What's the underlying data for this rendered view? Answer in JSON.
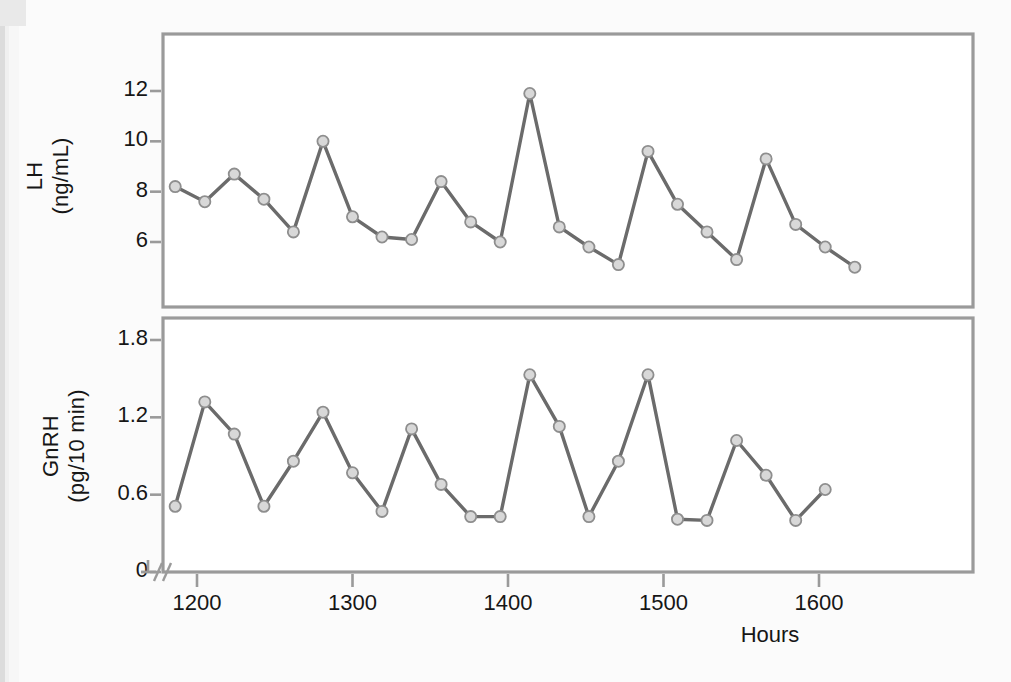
{
  "figure": {
    "background_color": "#fbfbfb",
    "frame_color": "#9a9a9a",
    "line_color": "#6b6b6b",
    "marker_fill": "#d8d8d8",
    "marker_stroke": "#8e8e8e",
    "text_color": "#161616",
    "xlabel": "Hours",
    "x_ticks": [
      "1200",
      "1300",
      "1400",
      "1500",
      "1600"
    ],
    "axis_break_symbol": "//"
  },
  "panels": {
    "top": {
      "ylabel_line1": "LH",
      "ylabel_line2": "(ng/mL)",
      "y_ticks": [
        "12",
        "10",
        "8",
        "6"
      ]
    },
    "bottom": {
      "ylabel_line1": "GnRH",
      "ylabel_line2": "(pg/10 min)",
      "y_ticks": [
        "1.8",
        "1.2",
        "0.6",
        "0"
      ]
    }
  },
  "chart_data": [
    {
      "type": "line",
      "title": "",
      "xlabel": "Hours",
      "ylabel": "LH (ng/mL)",
      "xlim": [
        1186,
        1625
      ],
      "ylim": [
        4.0,
        13.1
      ],
      "y_ticks": [
        12,
        10,
        8,
        6
      ],
      "x_ticks": [
        1200,
        1300,
        1400,
        1500,
        1600
      ],
      "grid": false,
      "legend": "none",
      "axis_break_x": true,
      "series": [
        {
          "name": "LH",
          "x": [
            1186,
            1205,
            1224,
            1243,
            1262,
            1281,
            1300,
            1319,
            1338,
            1357,
            1376,
            1395,
            1414,
            1433,
            1452,
            1471,
            1490,
            1509,
            1528,
            1547,
            1566,
            1585,
            1604,
            1623
          ],
          "values": [
            8.2,
            7.6,
            8.7,
            7.7,
            6.4,
            10.0,
            7.0,
            6.2,
            6.1,
            8.4,
            6.8,
            6.0,
            11.9,
            6.6,
            5.8,
            5.1,
            9.6,
            7.5,
            6.4,
            5.3,
            9.3,
            6.7,
            5.8,
            5.0
          ]
        }
      ]
    },
    {
      "type": "line",
      "title": "",
      "xlabel": "Hours",
      "ylabel": "GnRH (pg/10 min)",
      "xlim": [
        1186,
        1625
      ],
      "ylim": [
        0,
        2.0
      ],
      "y_ticks": [
        0,
        0.6,
        1.2,
        1.8
      ],
      "x_ticks": [
        1200,
        1300,
        1400,
        1500,
        1600
      ],
      "grid": false,
      "legend": "none",
      "axis_break_x": true,
      "axis_break_y": true,
      "series": [
        {
          "name": "GnRH",
          "x": [
            1186,
            1205,
            1224,
            1243,
            1262,
            1281,
            1300,
            1319,
            1338,
            1357,
            1376,
            1395,
            1414,
            1433,
            1452,
            1471,
            1490,
            1509,
            1528,
            1547,
            1566,
            1585,
            1604
          ],
          "values": [
            0.51,
            1.32,
            1.07,
            0.51,
            0.86,
            1.24,
            0.77,
            0.47,
            1.11,
            0.68,
            0.43,
            0.43,
            1.53,
            1.13,
            0.43,
            0.86,
            1.53,
            0.41,
            0.4,
            1.02,
            0.75,
            0.4,
            0.64
          ]
        }
      ]
    }
  ]
}
